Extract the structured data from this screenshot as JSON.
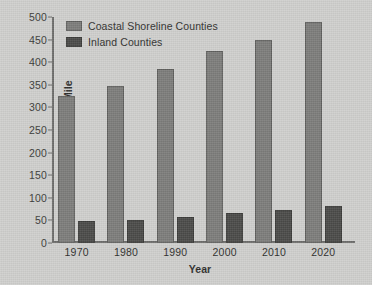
{
  "chart_data": {
    "type": "bar",
    "title": "",
    "xlabel": "Year",
    "ylabel": "Persons Per Square Mile",
    "categories": [
      "1970",
      "1980",
      "1990",
      "2000",
      "2010",
      "2020"
    ],
    "series": [
      {
        "name": "Coastal Shoreline Counties",
        "color": "#7c7c7a",
        "values": [
          325,
          348,
          385,
          425,
          450,
          490
        ]
      },
      {
        "name": "Inland Counties",
        "color": "#4a4a48",
        "values": [
          48,
          52,
          57,
          66,
          74,
          82
        ]
      }
    ],
    "ylim": [
      0,
      500
    ],
    "yticks": [
      "0",
      "50",
      "100",
      "150",
      "200",
      "250",
      "300",
      "350",
      "400",
      "450",
      "500"
    ],
    "ytick_values": [
      0,
      50,
      100,
      150,
      200,
      250,
      300,
      350,
      400,
      450,
      500
    ],
    "grid": false,
    "legend_position": "top-left"
  },
  "figure": {
    "background_color": "#cfcfcd",
    "axis_color": "#6d6d6b",
    "text_color": "#2e2e2c"
  }
}
